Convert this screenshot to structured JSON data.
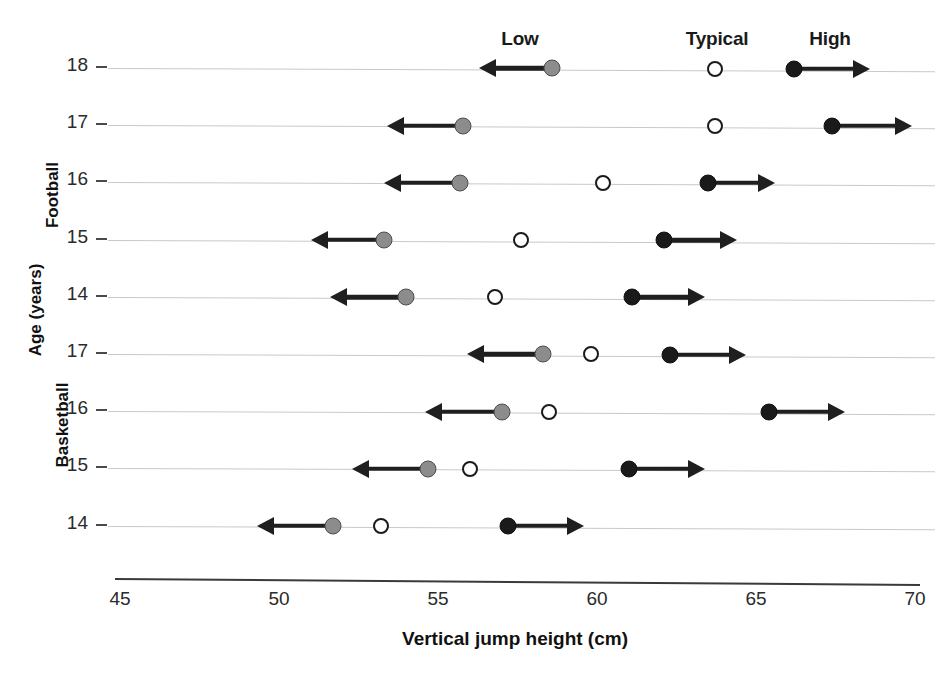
{
  "chart_data": {
    "type": "scatter",
    "title": "",
    "xlabel": "Vertical jump height (cm)",
    "ylabel": "Age (years)",
    "xlim": [
      45,
      70
    ],
    "xticks": [
      45,
      50,
      55,
      60,
      65,
      70
    ],
    "grid": true,
    "legend_position": "top",
    "column_headers": [
      "Low",
      "Typical",
      "High"
    ],
    "series": [
      {
        "name": "Low",
        "marker": "filled-grey-circle",
        "color": "#8c8c8c",
        "arrow": "left"
      },
      {
        "name": "Typical",
        "marker": "open-circle",
        "color": "#ffffff",
        "arrow": "none"
      },
      {
        "name": "High",
        "marker": "filled-black-circle",
        "color": "#1a1a1a",
        "arrow": "right"
      }
    ],
    "groups": [
      {
        "name": "Football",
        "rows": [
          {
            "age": "18",
            "low": 58.6,
            "typical": 63.7,
            "high": 66.2,
            "low_arrow_end": 56.3,
            "high_arrow_end": 68.6
          },
          {
            "age": "17",
            "low": 55.8,
            "typical": 63.7,
            "high": 67.4,
            "low_arrow_end": 53.4,
            "high_arrow_end": 69.9
          },
          {
            "age": "16",
            "low": 55.7,
            "typical": 60.2,
            "high": 63.5,
            "low_arrow_end": 53.3,
            "high_arrow_end": 65.6
          },
          {
            "age": "15",
            "low": 53.3,
            "typical": 57.6,
            "high": 62.1,
            "low_arrow_end": 51.0,
            "high_arrow_end": 64.4
          },
          {
            "age": "14",
            "low": 54.0,
            "typical": 56.8,
            "high": 61.1,
            "low_arrow_end": 51.6,
            "high_arrow_end": 63.4
          }
        ]
      },
      {
        "name": "Basketball",
        "rows": [
          {
            "age": "17",
            "low": 58.3,
            "typical": 59.8,
            "high": 62.3,
            "low_arrow_end": 55.9,
            "high_arrow_end": 64.7
          },
          {
            "age": "16",
            "low": 57.0,
            "typical": 58.5,
            "high": 65.4,
            "low_arrow_end": 54.6,
            "high_arrow_end": 67.8
          },
          {
            "age": "15",
            "low": 54.7,
            "typical": 56.0,
            "high": 61.0,
            "low_arrow_end": 52.3,
            "high_arrow_end": 63.4
          },
          {
            "age": "14",
            "low": 51.7,
            "typical": 53.2,
            "high": 57.2,
            "low_arrow_end": 49.3,
            "high_arrow_end": 59.6
          }
        ]
      }
    ]
  }
}
